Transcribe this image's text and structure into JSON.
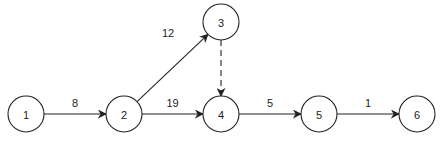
{
  "diagram": {
    "type": "activity-network",
    "nodes": [
      {
        "id": "1",
        "label": "1",
        "x": 26,
        "y": 114
      },
      {
        "id": "2",
        "label": "2",
        "x": 124,
        "y": 114
      },
      {
        "id": "3",
        "label": "3",
        "x": 221,
        "y": 22
      },
      {
        "id": "4",
        "label": "4",
        "x": 221,
        "y": 114
      },
      {
        "id": "5",
        "label": "5",
        "x": 319,
        "y": 114
      },
      {
        "id": "6",
        "label": "6",
        "x": 417,
        "y": 114
      }
    ],
    "edges": [
      {
        "from": "1",
        "to": "2",
        "label": "8",
        "style": "solid"
      },
      {
        "from": "2",
        "to": "3",
        "label": "12",
        "style": "solid"
      },
      {
        "from": "2",
        "to": "4",
        "label": "19",
        "style": "solid"
      },
      {
        "from": "3",
        "to": "4",
        "label": "",
        "style": "dashed"
      },
      {
        "from": "4",
        "to": "5",
        "label": "5",
        "style": "solid"
      },
      {
        "from": "5",
        "to": "6",
        "label": "1",
        "style": "solid"
      }
    ],
    "node_radius": 18,
    "stroke_color": "#222222"
  }
}
